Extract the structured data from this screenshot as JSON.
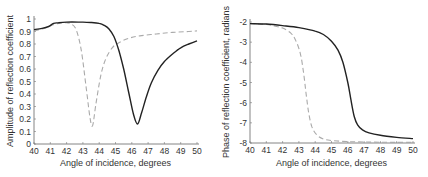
{
  "chart_data": [
    {
      "type": "line",
      "title": "",
      "xlabel": "Angle of incidence, degrees",
      "ylabel": "Amplitude of reflection coefficient",
      "xlim": [
        40,
        50
      ],
      "ylim": [
        0,
        1
      ],
      "xticks": [
        "40",
        "41",
        "42",
        "43",
        "44",
        "45",
        "46",
        "47",
        "48",
        "49",
        "50"
      ],
      "yticks": [
        "0",
        "0.1",
        "0.2",
        "0.3",
        "0.4",
        "0.5",
        "0.6",
        "0.7",
        "0.8",
        "0.9",
        "1"
      ],
      "grid": false,
      "series": [
        {
          "name": "solid",
          "style": "solid",
          "color": "#222222",
          "x": [
            40,
            40.5,
            40.9,
            41.2,
            41.5,
            42,
            43,
            43.5,
            44,
            44.3,
            44.6,
            44.9,
            45.2,
            45.5,
            45.8,
            46.1,
            46.35,
            46.6,
            46.9,
            47.2,
            47.6,
            48,
            48.5,
            49,
            49.5,
            50
          ],
          "y": [
            0.915,
            0.925,
            0.94,
            0.965,
            0.97,
            0.975,
            0.975,
            0.972,
            0.965,
            0.95,
            0.92,
            0.86,
            0.75,
            0.6,
            0.42,
            0.24,
            0.16,
            0.25,
            0.38,
            0.49,
            0.59,
            0.66,
            0.72,
            0.77,
            0.8,
            0.825
          ]
        },
        {
          "name": "dashed",
          "style": "dashed",
          "color": "#aaaaaa",
          "x": [
            40,
            40.5,
            41,
            41.5,
            42,
            42.3,
            42.6,
            42.9,
            43.2,
            43.45,
            43.6,
            43.8,
            44.1,
            44.4,
            44.8,
            45.2,
            45.8,
            46.5,
            47.5,
            48.5,
            49.5,
            50
          ],
          "y": [
            0.905,
            0.92,
            0.945,
            0.965,
            0.97,
            0.96,
            0.91,
            0.75,
            0.45,
            0.2,
            0.15,
            0.32,
            0.55,
            0.68,
            0.77,
            0.81,
            0.845,
            0.865,
            0.88,
            0.893,
            0.9,
            0.905
          ]
        }
      ]
    },
    {
      "type": "line",
      "title": "",
      "xlabel": "Angle of incidence, degrees",
      "ylabel": "Phase of reflection coefficient, radians",
      "xlim": [
        40,
        50
      ],
      "ylim": [
        -8,
        -2
      ],
      "xticks": [
        "40",
        "41",
        "42",
        "43",
        "44",
        "45",
        "46",
        "47",
        "48",
        "49",
        "50"
      ],
      "yticks": [
        "-2",
        "-3",
        "-4",
        "-5",
        "-6",
        "-7",
        "-8"
      ],
      "grid": false,
      "series": [
        {
          "name": "solid",
          "style": "solid",
          "color": "#222222",
          "x": [
            40,
            41,
            42,
            43,
            44,
            44.5,
            45,
            45.4,
            45.7,
            46,
            46.2,
            46.4,
            46.6,
            46.9,
            47.3,
            48,
            49,
            50
          ],
          "y": [
            -2.08,
            -2.1,
            -2.18,
            -2.28,
            -2.45,
            -2.62,
            -2.95,
            -3.4,
            -4.0,
            -5.0,
            -5.9,
            -6.7,
            -7.1,
            -7.35,
            -7.5,
            -7.62,
            -7.72,
            -7.78
          ]
        },
        {
          "name": "dashed",
          "style": "dashed",
          "color": "#aaaaaa",
          "x": [
            40,
            41,
            41.5,
            42,
            42.5,
            42.8,
            43.1,
            43.3,
            43.45,
            43.6,
            43.8,
            44.1,
            44.5,
            45,
            46,
            47,
            48,
            49,
            50
          ],
          "y": [
            -2.08,
            -2.12,
            -2.2,
            -2.3,
            -2.55,
            -2.9,
            -3.6,
            -4.6,
            -5.6,
            -6.5,
            -7.2,
            -7.6,
            -7.8,
            -7.88,
            -7.93,
            -7.95,
            -7.96,
            -7.97,
            -7.97
          ]
        }
      ]
    }
  ]
}
